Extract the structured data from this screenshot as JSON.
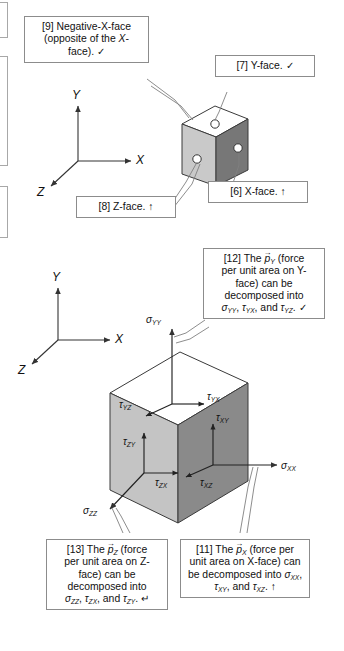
{
  "figure": {
    "background": "#ffffff",
    "line_color": "#555555",
    "box_border": "#8c8c8c"
  },
  "top_panel": {
    "axes": {
      "y": "Y",
      "x": "X",
      "z": "Z"
    },
    "cube": {
      "top_face_color": "#ffffff",
      "left_face_color": "#c9c9c9",
      "right_face_color": "#777777",
      "markers": [
        "y-face-dot",
        "z-face-dot",
        "x-face-dot"
      ]
    },
    "callouts": [
      {
        "id": "callout-9",
        "tag": "[9]",
        "text": "[9] Negative-X-face (opposite of the X-face).",
        "line1": "[9] Negative-X-face",
        "line2": "(opposite of the X-",
        "line3": "face).",
        "mark": "✓"
      },
      {
        "id": "callout-7",
        "tag": "[7]",
        "text": "[7] Y-face.",
        "mark": "✓"
      },
      {
        "id": "callout-8",
        "tag": "[8]",
        "text": "[8] Z-face.",
        "mark": "↑"
      },
      {
        "id": "callout-6",
        "tag": "[6]",
        "text": "[6] X-face.",
        "mark": "↑"
      }
    ]
  },
  "bottom_panel": {
    "axes": {
      "y": "Y",
      "x": "X",
      "z": "Z"
    },
    "cube": {
      "top_face_color": "#ffffff",
      "left_face_color": "#c4c4c4",
      "right_face_color": "#8a8a8a"
    },
    "stress_labels": [
      {
        "id": "sigma-yy",
        "sym": "σ",
        "sub": "YY"
      },
      {
        "id": "tau-yx",
        "sym": "τ",
        "sub": "YX"
      },
      {
        "id": "tau-yz",
        "sym": "τ",
        "sub": "YZ"
      },
      {
        "id": "tau-xy",
        "sym": "τ",
        "sub": "XY"
      },
      {
        "id": "tau-zy",
        "sym": "τ",
        "sub": "ZY"
      },
      {
        "id": "tau-zx",
        "sym": "τ",
        "sub": "ZX"
      },
      {
        "id": "tau-xz",
        "sym": "τ",
        "sub": "XZ"
      },
      {
        "id": "sigma-xx",
        "sym": "σ",
        "sub": "XX"
      },
      {
        "id": "sigma-zz",
        "sym": "σ",
        "sub": "ZZ"
      }
    ],
    "callouts": [
      {
        "id": "callout-12",
        "tag": "[12]",
        "pre": "[12] The ",
        "vec": "p",
        "vec_sub": "Y",
        "line1": " (force",
        "line2": "per unit area on Y-",
        "line3": "face) can be",
        "line4": "decomposed into",
        "line5_a": "σ",
        "line5_a_sub": "YY",
        "line5_b": "τ",
        "line5_b_sub": "YX",
        "line5_mid": ", and ",
        "line5_c": "τ",
        "line5_c_sub": "YZ",
        "mark": "✓"
      },
      {
        "id": "callout-13",
        "tag": "[13]",
        "pre": "[13] The ",
        "vec": "p",
        "vec_sub": "Z",
        "line1": " (force",
        "line2": "per unit area on Z-",
        "line3": "face) can be",
        "line4": "decomposed into",
        "line5_a": "σ",
        "line5_a_sub": "ZZ",
        "line5_b": "τ",
        "line5_b_sub": "ZX",
        "line5_mid": ", and ",
        "line5_c": "τ",
        "line5_c_sub": "ZY",
        "mark": "↵"
      },
      {
        "id": "callout-11",
        "tag": "[11]",
        "pre": "[11] The ",
        "vec": "p",
        "vec_sub": "X",
        "line1": " (force per",
        "line2": "unit area on X-face) can",
        "line3": "be decomposed into ",
        "line3_a": "σ",
        "line3_a_sub": "XX",
        "line4_b": "τ",
        "line4_b_sub": "XY",
        "line4_mid": ", and ",
        "line4_c": "τ",
        "line4_c_sub": "XZ",
        "mark": "↑"
      }
    ]
  }
}
